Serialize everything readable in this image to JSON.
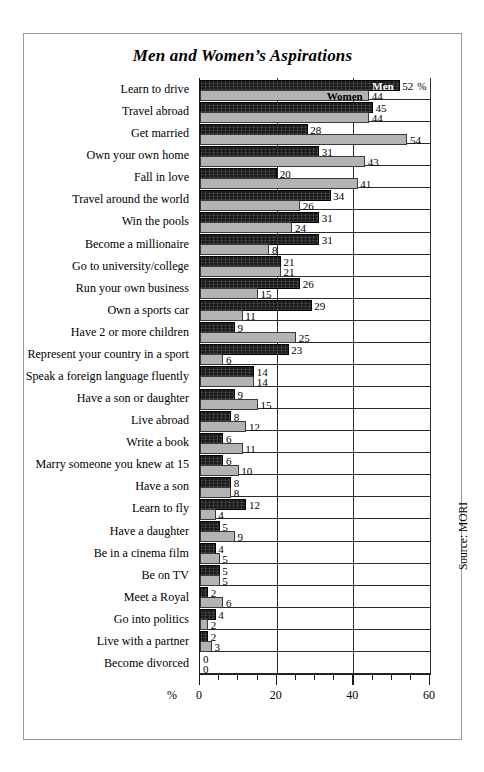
{
  "chart_data": {
    "type": "bar",
    "orientation": "horizontal",
    "title": "Men and Women’s Aspirations",
    "xlabel": "%",
    "ylabel": "",
    "xlim": [
      0,
      60
    ],
    "xticks": [
      0,
      20,
      40,
      60
    ],
    "xtick_labels": [
      "0",
      "20",
      "40",
      "60"
    ],
    "minor_tick_step": 5,
    "grid": "vertical gridlines at 20 and 40, frame at 0 and 60",
    "legend": {
      "position": "inline at end of first category bars",
      "entries": [
        {
          "name": "Men",
          "color": "#1a1a1a"
        },
        {
          "name": "Women",
          "color": "#b3b3b3"
        }
      ]
    },
    "value_suffix": "%",
    "first_value_suffix_label": "%",
    "source": "Source: MORI",
    "categories": [
      "Learn to drive",
      "Travel abroad",
      "Get married",
      "Own your own home",
      "Fall in love",
      "Travel around the world",
      "Win the pools",
      "Become a millionaire",
      "Go to university/college",
      "Run your own business",
      "Own a sports car",
      "Have 2 or more children",
      "Represent your country in a sport",
      "Speak a foreign language fluently",
      "Have a son or daughter",
      "Live abroad",
      "Write a book",
      "Marry someone you knew at 15",
      "Have a son",
      "Learn to fly",
      "Have a daughter",
      "Be in a cinema film",
      "Be on TV",
      "Meet a Royal",
      "Go into politics",
      "Live with a partner",
      "Become divorced"
    ],
    "series": [
      {
        "name": "Men",
        "color": "#1a1a1a",
        "values": [
          52,
          45,
          28,
          31,
          20,
          34,
          31,
          31,
          21,
          26,
          29,
          9,
          23,
          14,
          9,
          8,
          6,
          6,
          8,
          12,
          5,
          4,
          5,
          2,
          4,
          2,
          0
        ]
      },
      {
        "name": "Women",
        "color": "#b3b3b3",
        "values": [
          44,
          44,
          54,
          43,
          41,
          26,
          24,
          8,
          21,
          15,
          11,
          25,
          6,
          14,
          15,
          12,
          11,
          10,
          8,
          4,
          9,
          5,
          5,
          6,
          2,
          3,
          0
        ]
      }
    ],
    "women_bar_drawn_lengths": [
      44,
      44,
      54,
      43,
      41,
      26,
      24,
      18,
      21,
      15,
      11,
      25,
      6,
      14,
      15,
      12,
      11,
      10,
      8,
      4,
      9,
      5,
      5,
      6,
      2,
      3,
      0
    ]
  }
}
